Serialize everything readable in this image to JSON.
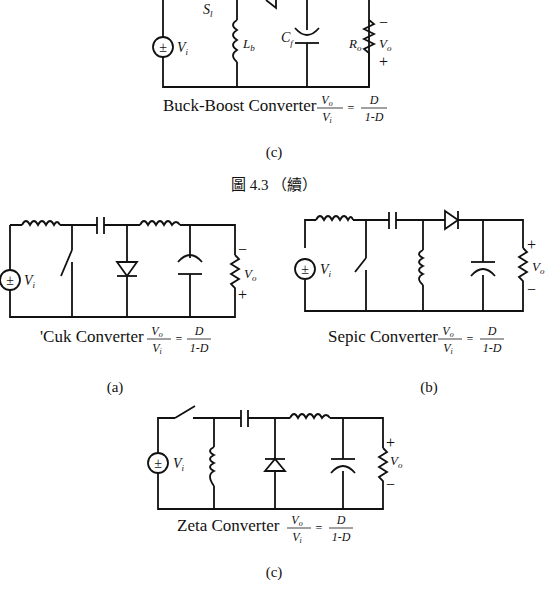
{
  "figure_top": {
    "title": "Buck-Boost Converter",
    "formula": {
      "lhs_num": "V",
      "lhs_num_sub": "o",
      "lhs_den": "V",
      "lhs_den_sub": "i",
      "eq": "=",
      "rhs_num": "D",
      "rhs_den": "1-D"
    },
    "sublabel": "(c)",
    "labels": {
      "switch": "S",
      "switch_sub": "l",
      "inductor": "L",
      "inductor_sub": "b",
      "capacitor": "C",
      "capacitor_sub": "f",
      "resistor": "R",
      "resistor_sub": "o",
      "vin": "V",
      "vin_sub": "i",
      "vout": "V",
      "vout_sub": "o",
      "minus": "−",
      "plus": "+"
    }
  },
  "figure_caption": "圖 4.3 （續）",
  "circuits": [
    {
      "id": "cuk",
      "title": "'Cuk Converter",
      "formula": {
        "lhs_num": "V",
        "lhs_num_sub": "o",
        "lhs_den": "V",
        "lhs_den_sub": "i",
        "eq": "=",
        "rhs_num": "D",
        "rhs_den": "1-D"
      },
      "sublabel": "(a)",
      "labels": {
        "vin": "V",
        "vin_sub": "i",
        "vout": "V",
        "vout_sub": "o",
        "top_sign": "−",
        "bottom_sign": "+"
      }
    },
    {
      "id": "sepic",
      "title": "Sepic Converter",
      "formula": {
        "lhs_num": "V",
        "lhs_num_sub": "o",
        "lhs_den": "V",
        "lhs_den_sub": "i",
        "eq": "=",
        "rhs_num": "D",
        "rhs_den": "1-D"
      },
      "sublabel": "(b)",
      "labels": {
        "vin": "V",
        "vin_sub": "i",
        "vout": "V",
        "vout_sub": "o",
        "top_sign": "+",
        "bottom_sign": "−"
      }
    },
    {
      "id": "zeta",
      "title": "Zeta Converter",
      "formula": {
        "lhs_num": "V",
        "lhs_num_sub": "o",
        "lhs_den": "V",
        "lhs_den_sub": "i",
        "eq": "=",
        "rhs_num": "D",
        "rhs_den": "1-D"
      },
      "sublabel": "(c)",
      "labels": {
        "vin": "V",
        "vin_sub": "i",
        "vout": "V",
        "vout_sub": "o",
        "top_sign": "+",
        "bottom_sign": "−"
      }
    }
  ]
}
